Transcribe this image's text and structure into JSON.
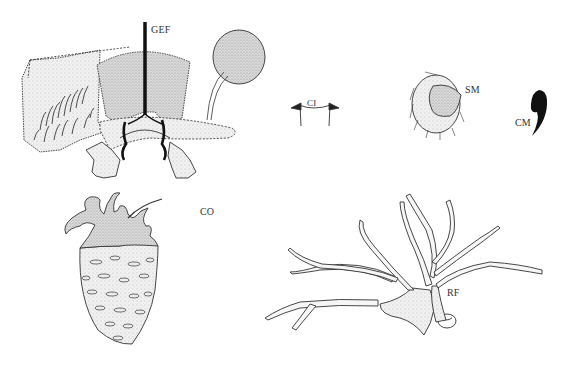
{
  "figure": {
    "type": "morphological illustration plate",
    "labels": {
      "gef": "GEF",
      "ci": "CI",
      "sm": "SM",
      "cm": "CM",
      "co": "CO",
      "rf": "RF"
    },
    "colors": {
      "line": "#333333",
      "stipple_fill": "#e4e4e4",
      "dense_fill": "#cfcfcf",
      "solid": "#111111",
      "background": "#ffffff"
    }
  }
}
